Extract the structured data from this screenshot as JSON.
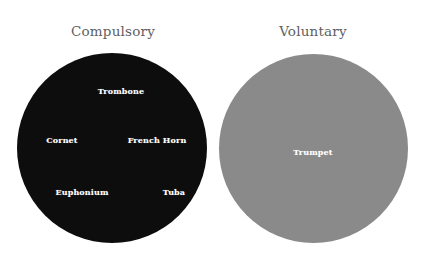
{
  "figure": {
    "background_color": "#ffffff",
    "width": 431,
    "height": 267
  },
  "sets": {
    "compulsory": {
      "title": "Compulsory",
      "fill_color": "#0d0d0d",
      "label_color": "#ffffff"
    },
    "voluntary": {
      "title": "Voluntary",
      "fill_color": "#8a8a8a",
      "label_color": "#ffffff"
    }
  },
  "title_color": "#5e5e5e",
  "items": {
    "trombone": "Trombone",
    "cornet": "Cornet",
    "french_horn": "French Horn",
    "euphonium": "Euphonium",
    "tuba": "Tuba",
    "trumpet": "Trumpet"
  },
  "chart_data": {
    "type": "venn",
    "title": "",
    "legend": "none",
    "grid": false,
    "sets": [
      {
        "name": "Compulsory",
        "color": "#0d0d0d",
        "center": [
          112,
          148
        ],
        "radius": 95,
        "count": 5,
        "members": [
          "Trombone",
          "Cornet",
          "French Horn",
          "Euphonium",
          "Tuba"
        ]
      },
      {
        "name": "Voluntary",
        "color": "#8a8a8a",
        "center": [
          313,
          148
        ],
        "radius": 94.5,
        "count": 1,
        "members": [
          "Trumpet"
        ]
      }
    ],
    "intersections": [
      {
        "sets": [
          "Compulsory",
          "Voluntary"
        ],
        "count": 0,
        "members": []
      }
    ],
    "annotations": [
      {
        "text": "Trombone",
        "set": "Compulsory",
        "x": 121,
        "y": 91
      },
      {
        "text": "Cornet",
        "set": "Compulsory",
        "x": 62,
        "y": 140
      },
      {
        "text": "French Horn",
        "set": "Compulsory",
        "x": 157,
        "y": 140
      },
      {
        "text": "Euphonium",
        "set": "Compulsory",
        "x": 82,
        "y": 192
      },
      {
        "text": "Tuba",
        "set": "Compulsory",
        "x": 174,
        "y": 192
      },
      {
        "text": "Trumpet",
        "set": "Voluntary",
        "x": 313,
        "y": 152
      }
    ]
  }
}
